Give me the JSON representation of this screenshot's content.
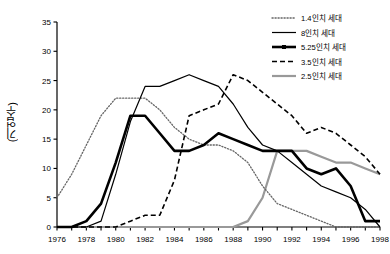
{
  "chart_data": {
    "type": "line",
    "title": "",
    "xlabel": "",
    "ylabel": "(기업수)",
    "xlim": [
      1976,
      1998
    ],
    "ylim": [
      0,
      35
    ],
    "ytick_step": 5,
    "xtick_label_step": 2,
    "xtick_minor_step": 1,
    "grid": false,
    "legend_position": "top-right",
    "x": [
      1976,
      1977,
      1978,
      1979,
      1980,
      1981,
      1982,
      1983,
      1984,
      1985,
      1986,
      1987,
      1988,
      1989,
      1990,
      1991,
      1992,
      1993,
      1994,
      1995,
      1996,
      1997,
      1998
    ],
    "yticks": [
      0,
      5,
      10,
      15,
      20,
      25,
      30,
      35
    ],
    "xticks_labeled": [
      1976,
      1978,
      1980,
      1982,
      1984,
      1986,
      1988,
      1990,
      1992,
      1994,
      1996,
      1998
    ],
    "series": [
      {
        "name": "1.4인치 세대",
        "style": "dotted",
        "color": "#666666",
        "values": [
          5,
          9,
          14,
          19,
          22,
          22,
          22,
          20,
          17,
          15,
          14,
          14,
          13,
          11,
          7,
          4,
          3,
          2,
          1,
          0,
          0,
          0,
          0
        ]
      },
      {
        "name": "8인치 세대",
        "style": "solid-thin",
        "color": "#000000",
        "values": [
          0,
          0,
          0,
          1,
          9,
          18,
          24,
          24,
          25,
          26,
          25,
          24,
          21,
          17,
          14,
          13,
          11,
          9,
          7,
          6,
          5,
          3,
          0
        ]
      },
      {
        "name": "5.25인치 세대",
        "style": "solid-thick",
        "color": "#000000",
        "values": [
          0,
          0,
          1,
          4,
          11,
          19,
          19,
          16,
          13,
          13,
          14,
          16,
          15,
          14,
          13,
          13,
          13,
          10,
          9,
          10,
          7,
          1,
          1
        ]
      },
      {
        "name": "3.5인치 세대",
        "style": "dashed",
        "color": "#000000",
        "values": [
          0,
          0,
          0,
          0,
          0,
          1,
          2,
          2,
          8,
          19,
          20,
          21,
          26,
          25,
          23,
          21,
          19,
          16,
          17,
          16,
          14,
          12,
          9
        ]
      },
      {
        "name": "2.5인치 세대",
        "style": "solid-gray",
        "color": "#999999",
        "values": [
          0,
          0,
          0,
          0,
          0,
          0,
          0,
          0,
          0,
          0,
          0,
          0,
          0,
          1,
          5,
          13,
          13,
          13,
          12,
          11,
          11,
          10,
          9
        ]
      }
    ]
  },
  "legend": {
    "entries": [
      {
        "label": "1.4인치 세대"
      },
      {
        "label": "8인치 세대"
      },
      {
        "label": "5.25인치 세대"
      },
      {
        "label": "3.5인치 세대"
      },
      {
        "label": "2.5인치 세대"
      }
    ]
  },
  "axis": {
    "y_axis_title": "(기업수)"
  }
}
